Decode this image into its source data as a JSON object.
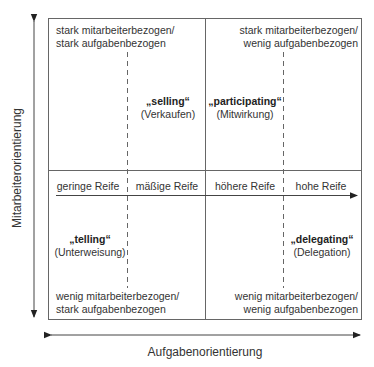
{
  "diagram": {
    "type": "quadrant-matrix",
    "axes": {
      "y_label": "Mitarbeiterorientierung",
      "x_label": "Aufgabenorientierung"
    },
    "maturity_scale": [
      "geringe Reife",
      "mäßige Reife",
      "höhere Reife",
      "hohe Reife"
    ],
    "quadrants": {
      "top_left": {
        "corner_line1": "stark mitarbeiterbezogen/",
        "corner_line2": "stark aufgabenbezogen",
        "style": "„selling“",
        "style_de": "(Verkaufen)"
      },
      "top_right": {
        "corner_line1": "stark mitarbeiterbezogen/",
        "corner_line2": "wenig aufgabenbezogen",
        "style": "„participating“",
        "style_de": "(Mitwirkung)"
      },
      "bottom_left": {
        "corner_line1": "wenig mitarbeiterbezogen/",
        "corner_line2": "stark aufgabenbezogen",
        "style": "„telling“",
        "style_de": "(Unterweisung)"
      },
      "bottom_right": {
        "corner_line1": "wenig mitarbeiterbezogen/",
        "corner_line2": "wenig aufgabenbezogen",
        "style": "„delegating“",
        "style_de": "(Delegation)"
      }
    },
    "colors": {
      "line": "#555555",
      "text": "#333333"
    }
  }
}
